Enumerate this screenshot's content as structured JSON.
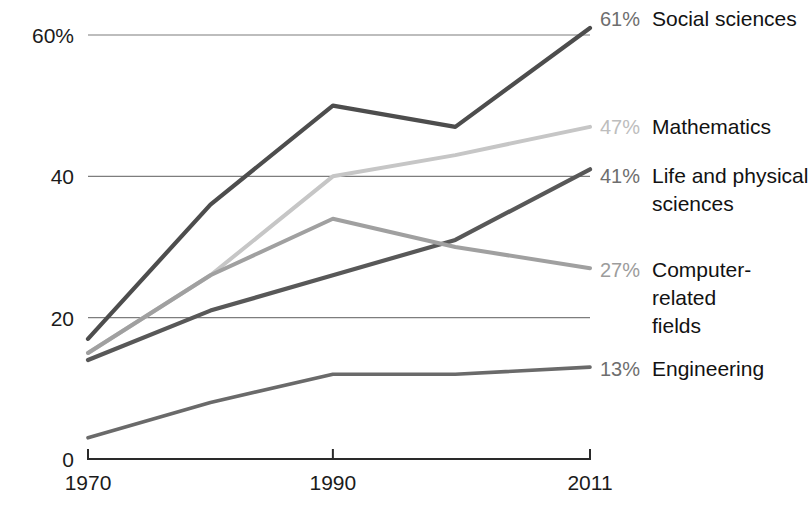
{
  "chart_data": {
    "type": "line",
    "title": "",
    "subtitle": "",
    "xlabel": "",
    "ylabel": "",
    "x": [
      1970,
      1980,
      1990,
      2000,
      2011
    ],
    "xtick_labels": [
      "1970",
      "1990",
      "2011"
    ],
    "xticks": [
      1970,
      1990,
      2011
    ],
    "ytick_labels": [
      "60%",
      "40",
      "20",
      "0"
    ],
    "yticks": [
      60,
      40,
      20,
      0
    ],
    "ylim": [
      0,
      65
    ],
    "xlim": [
      1970,
      2011
    ],
    "grid": true,
    "grid_axis": "y",
    "legend_position": "right-inline-end-labels",
    "series": [
      {
        "name": "Social sciences",
        "end_value_label": "61%",
        "end_value": 61,
        "color": "#4d4d4d",
        "values": [
          17,
          36,
          50,
          47,
          61
        ],
        "label_lines": [
          "Social sciences"
        ]
      },
      {
        "name": "Mathematics",
        "end_value_label": "47%",
        "end_value": 47,
        "color": "#c6c6c6",
        "values": [
          15,
          26,
          40,
          43,
          47
        ],
        "label_lines": [
          "Mathematics"
        ]
      },
      {
        "name": "Life and physical sciences",
        "end_value_label": "41%",
        "end_value": 41,
        "color": "#585858",
        "values": [
          14,
          21,
          26,
          31,
          41
        ],
        "label_lines": [
          "Life and physical",
          "sciences"
        ]
      },
      {
        "name": "Computer-related fields",
        "end_value_label": "27%",
        "end_value": 27,
        "color": "#a0a0a0",
        "values": [
          15,
          26,
          34,
          30,
          27
        ],
        "label_lines": [
          "Computer-",
          "related",
          "fields"
        ]
      },
      {
        "name": "Engineering",
        "end_value_label": "13%",
        "end_value": 13,
        "color": "#6a6a6a",
        "values": [
          3,
          8,
          12,
          12,
          13
        ],
        "label_lines": [
          "Engineering"
        ]
      }
    ]
  },
  "axis": {
    "y_labels": [
      {
        "text": "60%",
        "value": 60
      },
      {
        "text": "40",
        "value": 40
      },
      {
        "text": "20",
        "value": 20
      },
      {
        "text": "0",
        "value": 0
      }
    ],
    "x_labels": [
      {
        "text": "1970",
        "value": 1970
      },
      {
        "text": "1990",
        "value": 1990
      },
      {
        "text": "2011",
        "value": 2011
      }
    ]
  }
}
